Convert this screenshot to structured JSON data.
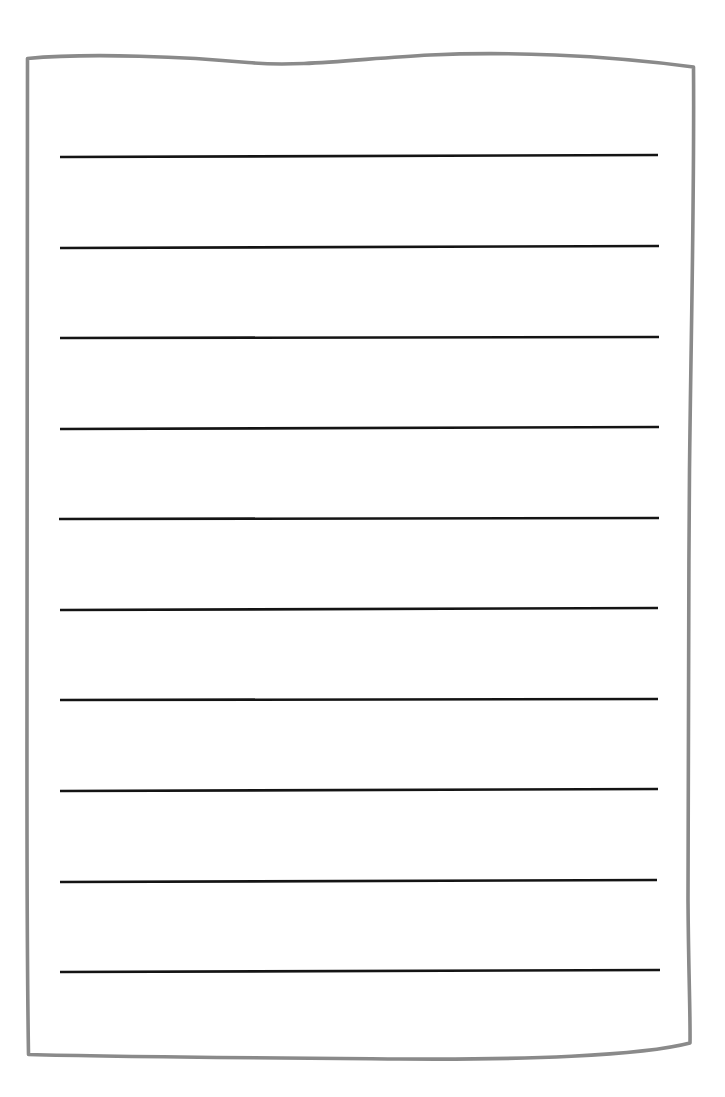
{
  "document": {
    "title": "Blank Lined Paper Worksheet",
    "kind": "worksheet",
    "background_color": "#ffffff",
    "canvas": {
      "width": 725,
      "height": 1097
    }
  },
  "sheet": {
    "name": "hand-drawn-paper-sheet",
    "stroke_color": "#8a8a8a",
    "fill_color": "#ffffff",
    "stroke_width": 3.6,
    "style": "hand-drawn wavy rectangle",
    "outline_path": "M 27.5 58.5 C 90 52.5 190 57 248 62.5 C 300 67.5 360 58.5 430 55 C 505 51.5 600 54.5 693.5 67 C 694.5 200 691 330 689.5 470 C 688.5 620 687.5 780 688 900 C 688.5 975 690.5 1015 690 1043 C 640 1056 520 1060 400 1059 C 270 1058 120 1057 28.5 1054.5 C 26.5 930 27 800 27 660 C 27 500 26.5 330 27.5 58.5 Z",
    "corners": {
      "top_left": [
        27,
        58
      ],
      "top_right": [
        693,
        67
      ],
      "bottom_right": [
        690,
        1043
      ],
      "bottom_left": [
        28,
        1054
      ]
    }
  },
  "rules": {
    "name": "writing-lines",
    "count": 10,
    "stroke_color": "#141414",
    "stroke_width": 2.6,
    "x_start": 60,
    "x_end": 659,
    "spacing": 90.5,
    "lines": [
      {
        "index": 1,
        "y_left": 157,
        "y_right": 155,
        "x_start": 60,
        "x_end": 658
      },
      {
        "index": 2,
        "y_left": 248,
        "y_right": 246,
        "x_start": 60,
        "x_end": 659
      },
      {
        "index": 3,
        "y_left": 338,
        "y_right": 337,
        "x_start": 60,
        "x_end": 659
      },
      {
        "index": 4,
        "y_left": 429,
        "y_right": 427,
        "x_start": 60,
        "x_end": 659
      },
      {
        "index": 5,
        "y_left": 519,
        "y_right": 518,
        "x_start": 59,
        "x_end": 659
      },
      {
        "index": 6,
        "y_left": 610,
        "y_right": 608,
        "x_start": 60,
        "x_end": 658
      },
      {
        "index": 7,
        "y_left": 700,
        "y_right": 699,
        "x_start": 60,
        "x_end": 658
      },
      {
        "index": 8,
        "y_left": 791,
        "y_right": 789,
        "x_start": 60,
        "x_end": 658
      },
      {
        "index": 9,
        "y_left": 882,
        "y_right": 880,
        "x_start": 60,
        "x_end": 657
      },
      {
        "index": 10,
        "y_left": 972,
        "y_right": 970,
        "x_start": 60,
        "x_end": 660
      }
    ]
  },
  "content": {
    "text_entries": [],
    "note": ""
  }
}
